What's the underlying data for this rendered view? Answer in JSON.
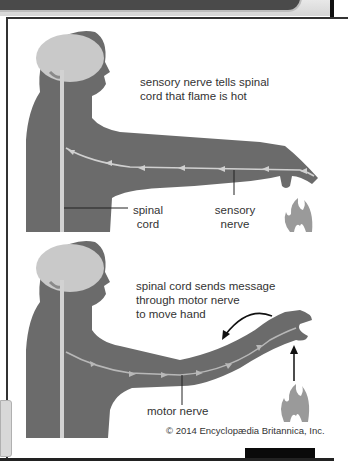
{
  "figure": {
    "panel_top": {
      "caption_line1": "sensory nerve tells spinal",
      "caption_line2": "cord that flame is hot",
      "label_spinal_line1": "spinal",
      "label_spinal_line2": "cord",
      "label_sensory_line1": "sensory",
      "label_sensory_line2": "nerve"
    },
    "panel_bottom": {
      "caption_line1": "spinal cord sends message",
      "caption_line2": "through motor nerve",
      "caption_line3": "to move hand",
      "label_motor": "motor nerve"
    },
    "copyright": "© 2014 Encyclopædia Britannica, Inc."
  },
  "colors": {
    "body": "#6b6b6b",
    "brain": "#c9c9c9",
    "nerve": "#c8c8c8",
    "flame": "#9a9a9a",
    "text": "#333333"
  }
}
